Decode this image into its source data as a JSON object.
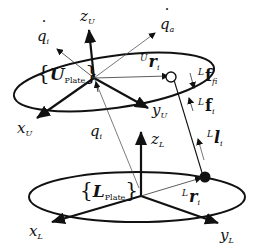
{
  "diagram": {
    "upper_plate": {
      "frame_label": "U",
      "frame_sub": "Plate",
      "axes": {
        "z": "z",
        "z_sub": "U",
        "x": "x",
        "x_sub": "U",
        "y": "y",
        "y_sub": "U"
      },
      "vector": {
        "pre": "U",
        "main": "r",
        "sub": "i"
      },
      "joint": "open-circle"
    },
    "lower_plate": {
      "frame_label": "L",
      "frame_sub": "Plate",
      "axes": {
        "z": "z",
        "z_sub": "L",
        "x": "x",
        "x_sub": "L",
        "y": "y",
        "y_sub": "L"
      },
      "vector": {
        "pre": "L",
        "main": "r",
        "sub": "i"
      },
      "joint": "filled-circle"
    },
    "velocities": {
      "qdot_i": {
        "main": "q",
        "sub": "i",
        "dot": "˙"
      },
      "qdot_a": {
        "main": "q",
        "sub": "a",
        "dot": "˙"
      }
    },
    "q_i": {
      "main": "q",
      "sub": "i"
    },
    "forces": {
      "f_fi": {
        "pre": "L",
        "main": "f",
        "sub": "fi"
      },
      "f_i": {
        "pre": "L",
        "main": "f",
        "sub": "i"
      },
      "l_i": {
        "pre": "L",
        "main": "l",
        "sub": "i"
      }
    },
    "colors": {
      "line": "#111111",
      "background": "#ffffff"
    }
  }
}
